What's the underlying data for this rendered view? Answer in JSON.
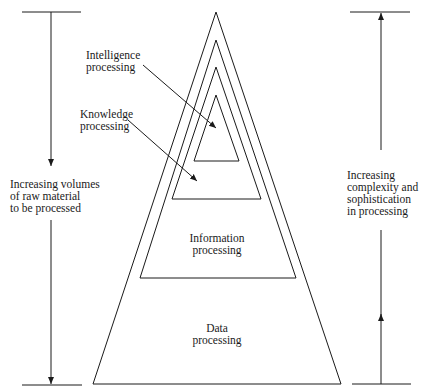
{
  "diagram": {
    "layers": [
      {
        "id": "data",
        "label": "Data\nprocessing"
      },
      {
        "id": "information",
        "label": "Information\nprocessing"
      },
      {
        "id": "knowledge",
        "label": "Knowledge\nprocessing"
      },
      {
        "id": "intelligence",
        "label": "Intelligence\nprocessing"
      }
    ],
    "left_axis": {
      "label": "Increasing volumes\nof raw material\nto be processed",
      "direction": "down"
    },
    "right_axis": {
      "label": "Increasing\ncomplexity and\nsophistication\nin processing",
      "direction": "up"
    },
    "line_color": "#1a1a1a"
  }
}
